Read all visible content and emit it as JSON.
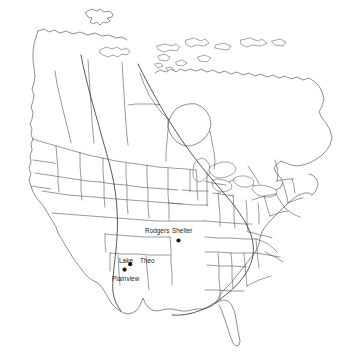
{
  "figure": {
    "kind": "outline-map",
    "region": "North America (United States, Canada, northern Mexico)",
    "background_color": "#ffffff",
    "outline_color": "#4a4a4a",
    "boundary_color": "#4f4f4f",
    "isoline_color": "#3a3a3a",
    "marker_color": "#111111",
    "label_color": "#1a1a1a",
    "width": 359,
    "height": 356
  },
  "sites": [
    {
      "id": "rodgers",
      "label": "Rodgers",
      "label_x": 145,
      "label_y": 233,
      "dot_x": 178,
      "dot_y": 240,
      "has_own_dot": false
    },
    {
      "id": "shelter",
      "label": "Shelter",
      "label_x": 172,
      "label_y": 233,
      "dot_x": 178.5,
      "dot_y": 240.5,
      "has_own_dot": true
    },
    {
      "id": "lake",
      "label": "Lake",
      "label_x": 119,
      "label_y": 263,
      "dot_x": 130,
      "dot_y": 264,
      "has_own_dot": true
    },
    {
      "id": "theo",
      "label": "Theo",
      "label_x": 140,
      "label_y": 263,
      "dot_x": 130,
      "dot_y": 264,
      "has_own_dot": false
    },
    {
      "id": "plainview",
      "label": "Plainview",
      "label_x": 113,
      "label_y": 281,
      "dot_x": 125,
      "dot_y": 270,
      "has_own_dot": true
    }
  ],
  "markers": [
    {
      "name": "rodgers-shelter-marker",
      "x": 178.5,
      "y": 240.5,
      "r": 2.1
    },
    {
      "name": "lake-theo-marker",
      "x": 130.2,
      "y": 264.2,
      "r": 2.1
    },
    {
      "name": "plainview-marker",
      "x": 124.6,
      "y": 269.6,
      "r": 2.1
    }
  ],
  "isolines": [
    {
      "name": "western-isoline",
      "description": "north-south arcing line through the central plains"
    },
    {
      "name": "eastern-isoline",
      "description": "arc sweeping from northwest territories to the gulf coast"
    }
  ]
}
